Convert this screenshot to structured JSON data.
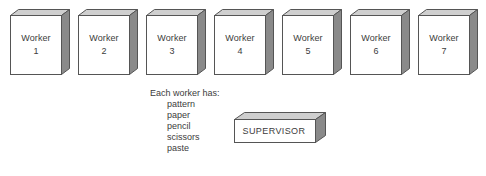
{
  "diagram": {
    "colors": {
      "front_face": "#ffffff",
      "top_face": "#cfcfcf",
      "side_face": "#8a8a8a",
      "outline": "#555555",
      "text": "#3c3c3c",
      "background": "#ffffff"
    },
    "workers": [
      {
        "role": "Worker",
        "number": "1"
      },
      {
        "role": "Worker",
        "number": "2"
      },
      {
        "role": "Worker",
        "number": "3"
      },
      {
        "role": "Worker",
        "number": "4"
      },
      {
        "role": "Worker",
        "number": "5"
      },
      {
        "role": "Worker",
        "number": "6"
      },
      {
        "role": "Worker",
        "number": "7"
      }
    ],
    "supervisor": {
      "label": "SUPERVISOR"
    },
    "supplies": {
      "heading": "Each worker has:",
      "items": [
        "pattern",
        "paper",
        "pencil",
        "scissors",
        "paste"
      ]
    }
  }
}
